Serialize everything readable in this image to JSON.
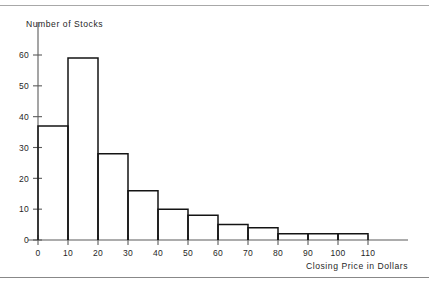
{
  "chart_data": {
    "type": "bar",
    "title": "",
    "subtitle": "",
    "xlabel": "Closing Price in Dollars",
    "ylabel": "Number of Stocks",
    "grid": false,
    "legend": null,
    "xlim": [
      0,
      110
    ],
    "ylim": [
      0,
      65
    ],
    "bin_width": 10,
    "bin_edges": [
      0,
      10,
      20,
      30,
      40,
      50,
      60,
      70,
      80,
      90,
      100,
      110
    ],
    "categories": [
      "0-10",
      "10-20",
      "20-30",
      "30-40",
      "40-50",
      "50-60",
      "60-70",
      "70-80",
      "80-90",
      "90-100",
      "100-110"
    ],
    "values": [
      37,
      59,
      28,
      16,
      10,
      8,
      5,
      4,
      2,
      2,
      2
    ],
    "xticks": [
      0,
      10,
      20,
      30,
      40,
      50,
      60,
      70,
      80,
      90,
      100,
      110
    ],
    "xticklabels": [
      "0",
      "10",
      "20",
      "30",
      "40",
      "50",
      "60",
      "70",
      "80",
      "90",
      "100",
      "110"
    ],
    "yticks": [
      0,
      10,
      20,
      30,
      40,
      50,
      60
    ],
    "yticklabels": [
      "0",
      "10",
      "20",
      "30",
      "40",
      "50",
      "60"
    ],
    "colors": {
      "bar_outline": "#141414",
      "bar_fill": "#ffffff",
      "axis": "#5b5b5b",
      "text": "#1f1f1f",
      "background": "#ffffff"
    }
  },
  "page": {
    "rule_color": "#a8a8a8"
  }
}
